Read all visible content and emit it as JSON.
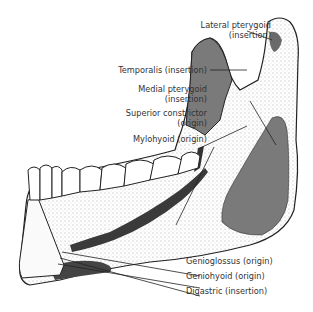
{
  "diagram": {
    "colors": {
      "muscle_area": "#7a7a7a",
      "insertion_dark": "#3a3a3a",
      "bone_outline": "#222222",
      "label_text": "#333333"
    },
    "labels": [
      {
        "id": "lateral-pterygoid",
        "line1": "Lateral pterygoid",
        "line2": "(insertion)"
      },
      {
        "id": "temporalis",
        "line1": "Temporalis (insertion)"
      },
      {
        "id": "medial-pterygoid",
        "line1": "Medial pterygoid",
        "line2": "(insertion)"
      },
      {
        "id": "superior-constrictor",
        "line1": "Superior constrictor",
        "line2": "(origin)"
      },
      {
        "id": "mylohyoid",
        "line1": "Mylohyoid (origin)"
      },
      {
        "id": "genioglossus",
        "line1": "Genioglossus (origin)"
      },
      {
        "id": "geniohyoid",
        "line1": "Geniohyoid (origin)"
      },
      {
        "id": "digastric",
        "line1": "Digastric (insertion)"
      }
    ]
  }
}
